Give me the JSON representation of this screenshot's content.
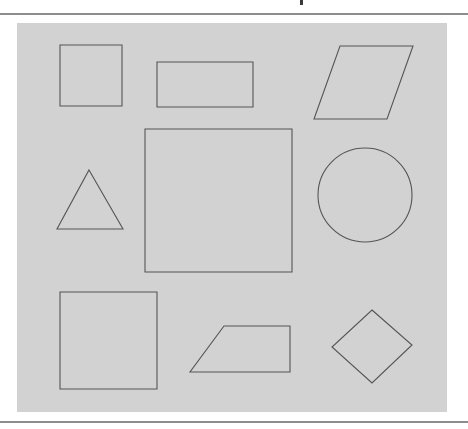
{
  "document": {
    "background_color": "#ffffff",
    "rule_color": "#8d8d8d",
    "top_rule_label": "top-horizontal-rule",
    "bottom_rule_label": "bottom-horizontal-rule",
    "clipped_text_fragment": ""
  },
  "figure": {
    "canvas_color": "#d2d2d2",
    "stroke_color": "#555555",
    "caption": "",
    "canvas": {
      "x": 17,
      "y": 23,
      "width": 430,
      "height": 389
    },
    "shapes": [
      {
        "name": "square-top-left",
        "kind": "square",
        "points": "43,22 105,22 105,83 43,83"
      },
      {
        "name": "rectangle-top-middle",
        "kind": "rectangle",
        "points": "140,39 236,39 236,84 140,84"
      },
      {
        "name": "parallelogram-top-right",
        "kind": "parallelogram",
        "points": "323,23 396,23 370,96 297,96"
      },
      {
        "name": "triangle-left",
        "kind": "triangle",
        "points": "72,147 106,206 40,206"
      },
      {
        "name": "square-center-large",
        "kind": "square",
        "points": "128,106 275,106 275,249 128,249"
      },
      {
        "name": "circle-right",
        "kind": "circle",
        "cx": 348,
        "cy": 172,
        "r": 47
      },
      {
        "name": "square-bottom-left",
        "kind": "square",
        "points": "43,269 140,269 140,366 43,366"
      },
      {
        "name": "trapezoid-bottom-middle",
        "kind": "trapezoid",
        "points": "207,303 273,303 273,349 173,349"
      },
      {
        "name": "diamond-bottom-right",
        "kind": "diamond",
        "points": "355,287 395,322 355,360 315,324"
      }
    ]
  }
}
